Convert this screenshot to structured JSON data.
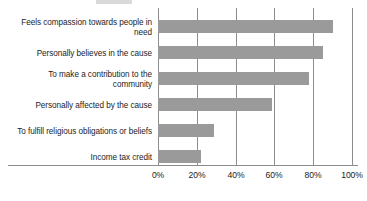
{
  "chart_data": {
    "type": "bar",
    "orientation": "horizontal",
    "title": "",
    "xlabel": "",
    "ylabel": "",
    "xlim": [
      0,
      100
    ],
    "grid": true,
    "legend": null,
    "units": "%",
    "categories": [
      "Feels compassion towards people in need",
      "Personally believes in the cause",
      "To make a contribution to the community",
      "Personally affected by the cause",
      "To fulfill religious obligations or beliefs",
      "Income tax credit"
    ],
    "values": [
      90,
      85,
      78,
      59,
      29,
      22
    ],
    "tick_labels": [
      "0%",
      "20%",
      "40%",
      "60%",
      "80%",
      "100%"
    ],
    "tick_values": [
      0,
      20,
      40,
      60,
      80,
      100
    ],
    "bar_color": "#9a9a9a",
    "axis_color": "#8d8d8d",
    "background_color": "#ffffff"
  },
  "labels": {
    "cat0_line1": "Feels compassion towards people in",
    "cat0_line2": "need",
    "cat1_line1": "Personally believes in the cause",
    "cat2_line1": "To make a contribution to the",
    "cat2_line2": "community",
    "cat3_line1": "Personally affected by the cause",
    "cat4_line1": "To fulfill religious obligations or beliefs",
    "cat5_line1": "Income tax credit"
  },
  "ticks": {
    "t0": "0%",
    "t1": "20%",
    "t2": "40%",
    "t3": "60%",
    "t4": "80%",
    "t5": "100%"
  }
}
